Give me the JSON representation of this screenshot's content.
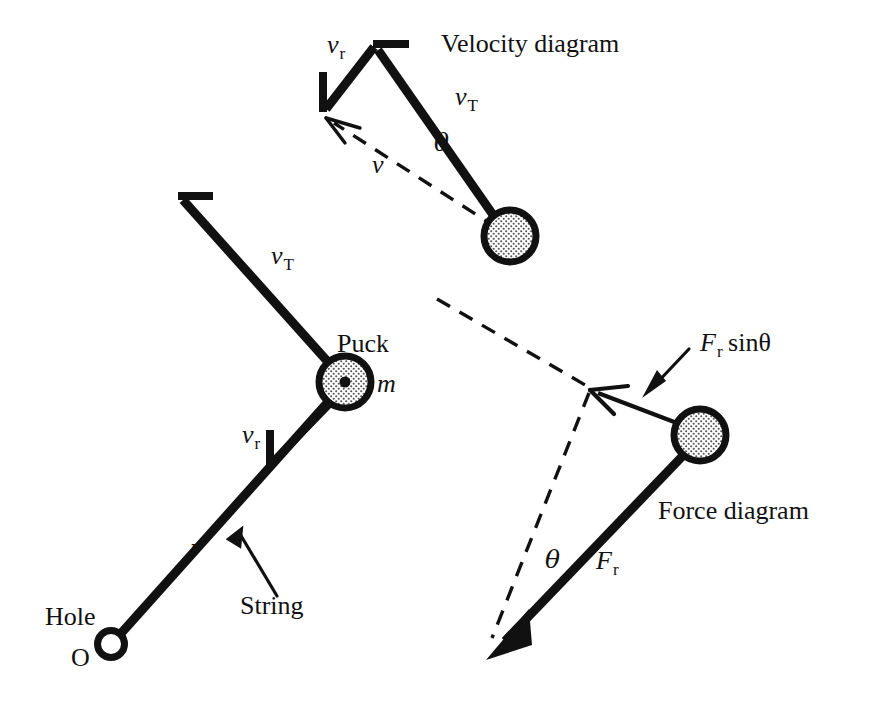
{
  "figure": {
    "title_velocity": "Velocity diagram",
    "title_force": "Force diagram",
    "background_color": "#ffffff",
    "ink_color": "#111111",
    "puck_fill_color": "#d9d9d9"
  },
  "labels": {
    "velocity_diagram": "Velocity diagram",
    "force_diagram": "Force diagram",
    "puck": "Puck",
    "mass": "m",
    "string": "String",
    "hole": "Hole",
    "origin": "O",
    "radius": "r",
    "v_letter": "v",
    "v_sub_r": "r",
    "v_sub_T": "T",
    "theta": "θ",
    "F_letter": "F",
    "F_sub_r": "r",
    "sin_theta": "sinθ",
    "v_resultant": "v"
  },
  "main_diagram": {
    "name": "puck-on-string-main",
    "hole_label": "Hole",
    "origin_label": "O",
    "radius_label": "r",
    "string_label": "String",
    "puck_label": "Puck",
    "mass_label": "m",
    "tangential_velocity_label": "v",
    "tangential_velocity_subscript": "T",
    "radial_velocity_label": "v",
    "radial_velocity_subscript": "r"
  },
  "velocity_diagram": {
    "name": "velocity-vector-triangle",
    "title": "Velocity diagram",
    "tangential_label": "v",
    "tangential_subscript": "T",
    "radial_label": "v",
    "radial_subscript": "r",
    "resultant_label": "v",
    "angle_label": "θ"
  },
  "force_diagram": {
    "name": "force-vector-triangle",
    "title": "Force diagram",
    "radial_force_label": "F",
    "radial_force_subscript": "r",
    "component_label": "F",
    "component_subscript": "r",
    "component_suffix": "sinθ",
    "angle_label": "θ"
  },
  "geometry": {
    "main": {
      "hole": [
        112,
        643
      ],
      "puck_center": [
        345,
        382
      ],
      "vT_tip": [
        178,
        198
      ],
      "vr_tip": [
        268,
        465
      ],
      "vr_tail": [
        335,
        397
      ]
    },
    "velocity": {
      "puck_center": [
        510,
        236
      ],
      "apex": [
        374,
        46
      ],
      "vr_tip": [
        323,
        113
      ],
      "v_tip": [
        330,
        120
      ]
    },
    "force": {
      "puck_center": [
        700,
        435
      ],
      "Fr_tip": [
        491,
        654
      ],
      "comp_tip": [
        592,
        390
      ],
      "dash_far": [
        438,
        298
      ]
    }
  }
}
